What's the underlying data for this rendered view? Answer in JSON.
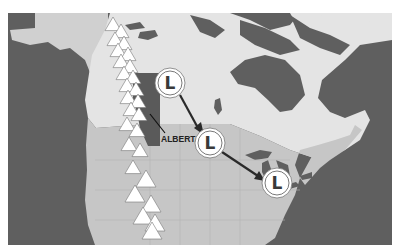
{
  "map": {
    "title": "Alberta Clipper storm track",
    "colors": {
      "ocean": "#5f5f5f",
      "canada": "#e4e4e4",
      "canada_west_north": "#d0d0d0",
      "usa": "#c6c6c6",
      "alberta": "#5a5a5a",
      "lakes": "#5f5f5f",
      "arrow": "#2a2a2a",
      "mountain": "#ffffff",
      "border_white": "#ffffff"
    },
    "region_label": "ALBERTA",
    "lows": [
      {
        "symbol": "L",
        "x": 170,
        "y": 83,
        "label": "Low pressure 1"
      },
      {
        "symbol": "L",
        "x": 210,
        "y": 143,
        "label": "Low pressure 2"
      },
      {
        "symbol": "L",
        "x": 277,
        "y": 183,
        "label": "Low pressure 3"
      }
    ],
    "mountains_label": "Rocky Mountains",
    "mountains": [
      [
        113,
        25
      ],
      [
        121,
        32
      ],
      [
        115,
        40
      ],
      [
        124,
        44
      ],
      [
        118,
        51
      ],
      [
        128,
        55
      ],
      [
        121,
        62
      ],
      [
        130,
        67
      ],
      [
        124,
        74
      ],
      [
        133,
        78
      ],
      [
        127,
        86
      ],
      [
        136,
        90
      ],
      [
        128,
        98
      ],
      [
        138,
        102
      ],
      [
        131,
        110
      ],
      [
        139,
        115
      ],
      [
        127,
        125
      ],
      [
        137,
        131
      ],
      [
        129,
        145
      ],
      [
        140,
        151
      ],
      [
        133,
        168
      ],
      [
        146,
        180
      ],
      [
        135,
        195
      ],
      [
        151,
        205
      ],
      [
        143,
        217
      ],
      [
        155,
        224
      ],
      [
        152,
        232
      ]
    ]
  }
}
